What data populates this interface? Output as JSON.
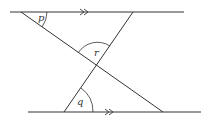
{
  "diagram": {
    "type": "geometry",
    "colors": {
      "line": "#333333",
      "background": "#ffffff"
    },
    "lines": {
      "top_parallel": {
        "x1": 10,
        "y1": 12,
        "x2": 184,
        "y2": 12,
        "arrow_mark": "double-arrow"
      },
      "bottom_parallel": {
        "x1": 28,
        "y1": 112,
        "x2": 201,
        "y2": 112,
        "arrow_mark": "double-arrow"
      },
      "transversal_a": {
        "x1": 21,
        "y1": 12,
        "x2": 163,
        "y2": 112
      },
      "transversal_b": {
        "x1": 133,
        "y1": 12,
        "x2": 64,
        "y2": 112
      }
    },
    "angles": [
      {
        "label": "p",
        "vertex": "top-left intersection",
        "x": 40,
        "y": 20
      },
      {
        "label": "r",
        "vertex": "transversals crossing",
        "x": 97,
        "y": 55
      },
      {
        "label": "q",
        "vertex": "bottom-left intersection",
        "x": 79,
        "y": 104
      }
    ]
  }
}
